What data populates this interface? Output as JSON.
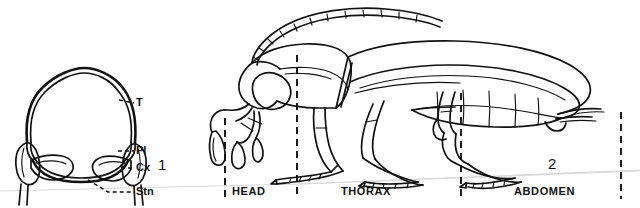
{
  "plate": {
    "background_color": "#ffffff",
    "ink_color": "#111111",
    "scanline_color": "#d9d9d9"
  },
  "figure1": {
    "number": "1",
    "caption_role": "cross-section-diagram",
    "labels": [
      {
        "key": "tergum",
        "text": "T",
        "name": "label-tergum"
      },
      {
        "key": "pleuron",
        "text": "Pl",
        "name": "label-pleuron"
      },
      {
        "key": "coxa",
        "text": "Cx",
        "name": "label-coxa"
      },
      {
        "key": "sternum",
        "text": "Stn",
        "name": "label-sternum"
      }
    ]
  },
  "figure2": {
    "number": "2",
    "caption_role": "lateral-habitus-diagram",
    "regions": [
      {
        "key": "head",
        "text": "HEAD",
        "name": "region-label-head"
      },
      {
        "key": "thorax",
        "text": "THORAX",
        "name": "region-label-thorax"
      },
      {
        "key": "abdomen",
        "text": "ABDOMEN",
        "name": "region-label-abdomen"
      }
    ],
    "dividers": 4
  }
}
